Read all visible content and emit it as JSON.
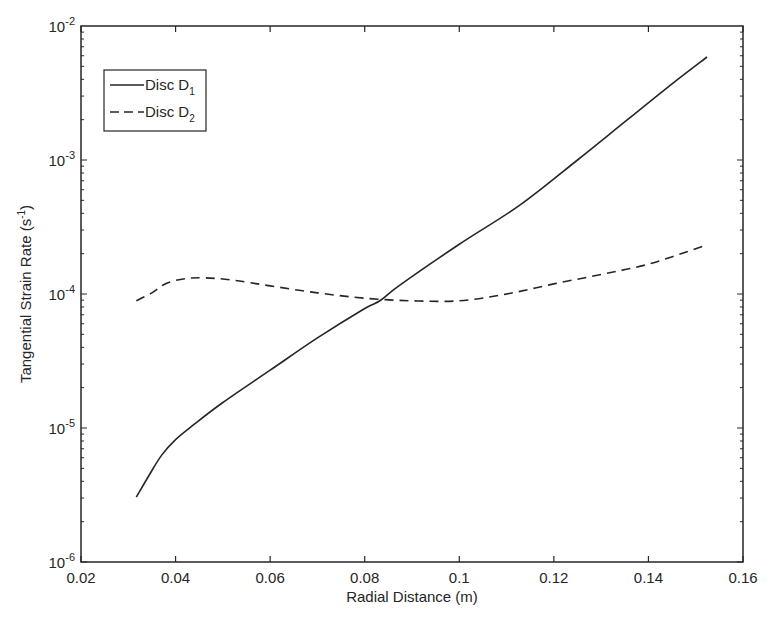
{
  "chart_data": {
    "type": "line",
    "title": "",
    "xlabel": "Radial Distance (m)",
    "ylabel": "Tangential Strain Rate (s^-1)",
    "ylabel_parts": {
      "main": "Tangential Strain Rate (s",
      "sup": "-1",
      "tail": ")"
    },
    "xscale": "linear",
    "yscale": "log",
    "xlim": [
      0.02,
      0.16
    ],
    "ylim": [
      1e-06,
      0.01
    ],
    "grid": false,
    "legend_position": "upper left",
    "x_ticks": [
      0.02,
      0.04,
      0.06,
      0.08,
      0.1,
      0.12,
      0.14,
      0.16
    ],
    "x_tick_labels": [
      "0.02",
      "0.04",
      "0.06",
      "0.08",
      "0.1",
      "0.12",
      "0.14",
      "0.16"
    ],
    "y_ticks": [
      1e-06,
      1e-05,
      0.0001,
      0.001,
      0.01
    ],
    "y_tick_labels": [
      {
        "base": "10",
        "exp": "-6"
      },
      {
        "base": "10",
        "exp": "-5"
      },
      {
        "base": "10",
        "exp": "-4"
      },
      {
        "base": "10",
        "exp": "-3"
      },
      {
        "base": "10",
        "exp": "-2"
      }
    ],
    "series": [
      {
        "name": "Disc D1",
        "legend_label": {
          "main": "Disc D",
          "sub": "1"
        },
        "style": "solid",
        "color": "#262626",
        "x": [
          0.0317,
          0.0345,
          0.0371,
          0.04,
          0.0437,
          0.05,
          0.06,
          0.07,
          0.08,
          0.0832,
          0.0875,
          0.1,
          0.1128,
          0.125,
          0.1355,
          0.145,
          0.1524
        ],
        "values": [
          3.05e-06,
          4.5e-06,
          6.3e-06,
          8.2e-06,
          1.05e-05,
          1.55e-05,
          2.7e-05,
          4.7e-05,
          7.8e-05,
          8.9e-05,
          0.000117,
          0.000235,
          0.00046,
          0.001,
          0.00199,
          0.0037,
          0.00587
        ]
      },
      {
        "name": "Disc D2",
        "legend_label": {
          "main": "Disc D",
          "sub": "2"
        },
        "style": "dashed",
        "color": "#262626",
        "x": [
          0.0317,
          0.035,
          0.038,
          0.042,
          0.0462,
          0.052,
          0.06,
          0.07,
          0.08,
          0.09,
          0.1,
          0.11,
          0.12,
          0.13,
          0.14,
          0.152
        ],
        "values": [
          8.9e-05,
          0.000102,
          0.00012,
          0.00013,
          0.000132,
          0.000127,
          0.000115,
          0.000102,
          9.3e-05,
          8.9e-05,
          8.9e-05,
          0.0001,
          0.000119,
          0.00014,
          0.000167,
          0.00023
        ]
      }
    ]
  }
}
